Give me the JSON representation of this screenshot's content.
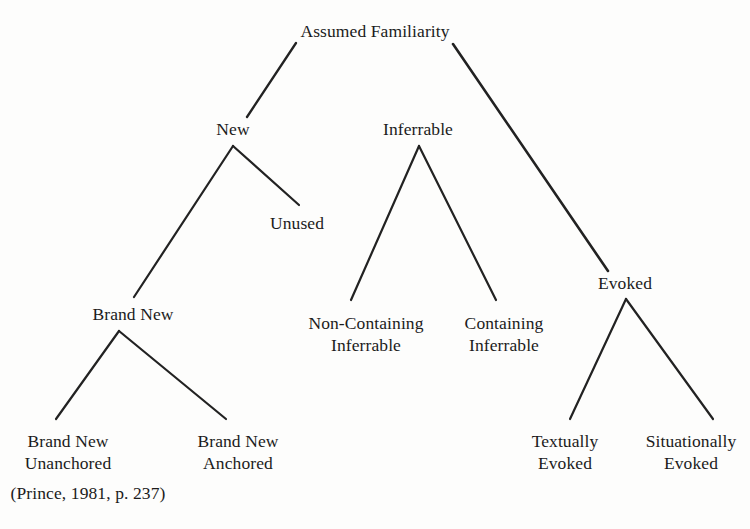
{
  "diagram": {
    "title_node": "Assumed Familiarity",
    "citation": "(Prince, 1981, p. 237)",
    "background_color": "#fdfdfc",
    "line_color": "#222222",
    "text_color": "#1b1b1b",
    "type": "tree",
    "nodes": [
      {
        "id": "assumed-familiarity",
        "label_line1": "Assumed Familiarity",
        "label_line2": "",
        "x": 375,
        "y": 20,
        "level": 0
      },
      {
        "id": "new",
        "label_line1": "New",
        "label_line2": "",
        "x": 233,
        "y": 118,
        "level": 1
      },
      {
        "id": "inferrable",
        "label_line1": "Inferrable",
        "label_line2": "",
        "x": 418,
        "y": 118,
        "level": 1
      },
      {
        "id": "evoked",
        "label_line1": "Evoked",
        "label_line2": "",
        "x": 625,
        "y": 272,
        "level": 1
      },
      {
        "id": "unused",
        "label_line1": "Unused",
        "label_line2": "",
        "x": 297,
        "y": 212,
        "level": 2
      },
      {
        "id": "brand-new",
        "label_line1": "Brand New",
        "label_line2": "",
        "x": 133,
        "y": 303,
        "level": 2
      },
      {
        "id": "non-containing-inferrable",
        "label_line1": "Non-Containing",
        "label_line2": "Inferrable",
        "x": 366,
        "y": 312,
        "level": 2
      },
      {
        "id": "containing-inferrable",
        "label_line1": "Containing",
        "label_line2": "Inferrable",
        "x": 504,
        "y": 312,
        "level": 2
      },
      {
        "id": "brand-new-unanchored",
        "label_line1": "Brand New",
        "label_line2": "Unanchored",
        "x": 68,
        "y": 430,
        "level": 3
      },
      {
        "id": "brand-new-anchored",
        "label_line1": "Brand New",
        "label_line2": "Anchored",
        "x": 238,
        "y": 430,
        "level": 3
      },
      {
        "id": "textually-evoked",
        "label_line1": "Textually",
        "label_line2": "Evoked",
        "x": 565,
        "y": 430,
        "level": 3
      },
      {
        "id": "situationally-evoked",
        "label_line1": "Situationally",
        "label_line2": "Evoked",
        "x": 691,
        "y": 430,
        "level": 3
      }
    ],
    "edges": [
      {
        "id": "edge-root-new",
        "from": "assumed-familiarity",
        "to": "new",
        "x1": 296,
        "y1": 43,
        "x2": 247,
        "y2": 117,
        "width": 2.3
      },
      {
        "id": "edge-root-evoked",
        "from": "assumed-familiarity",
        "to": "evoked",
        "x1": 453,
        "y1": 44,
        "x2": 608,
        "y2": 271,
        "width": 2.6
      },
      {
        "id": "edge-new-brandnew",
        "from": "new",
        "to": "brand-new",
        "x1": 233,
        "y1": 146,
        "x2": 134,
        "y2": 297,
        "width": 2.2
      },
      {
        "id": "edge-new-unused",
        "from": "new",
        "to": "unused",
        "x1": 233,
        "y1": 146,
        "x2": 299,
        "y2": 205,
        "width": 2.2
      },
      {
        "id": "edge-inferrable-noncontaining",
        "from": "inferrable",
        "to": "non-containing-inferrable",
        "x1": 419,
        "y1": 146,
        "x2": 351,
        "y2": 300,
        "width": 2.2
      },
      {
        "id": "edge-inferrable-containing",
        "from": "inferrable",
        "to": "containing-inferrable",
        "x1": 419,
        "y1": 146,
        "x2": 496,
        "y2": 300,
        "width": 2.2
      },
      {
        "id": "edge-brandnew-unanchored",
        "from": "brand-new",
        "to": "brand-new-unanchored",
        "x1": 119,
        "y1": 331,
        "x2": 56,
        "y2": 419,
        "width": 2.2
      },
      {
        "id": "edge-brandnew-anchored",
        "from": "brand-new",
        "to": "brand-new-anchored",
        "x1": 119,
        "y1": 331,
        "x2": 226,
        "y2": 419,
        "width": 2.2
      },
      {
        "id": "edge-evoked-textually",
        "from": "evoked",
        "to": "textually-evoked",
        "x1": 626,
        "y1": 299,
        "x2": 570,
        "y2": 419,
        "width": 2.2
      },
      {
        "id": "edge-evoked-situationally",
        "from": "evoked",
        "to": "situationally-evoked",
        "x1": 626,
        "y1": 299,
        "x2": 713,
        "y2": 419,
        "width": 2.2
      }
    ],
    "citation_position": {
      "x": 88,
      "y": 482
    }
  }
}
